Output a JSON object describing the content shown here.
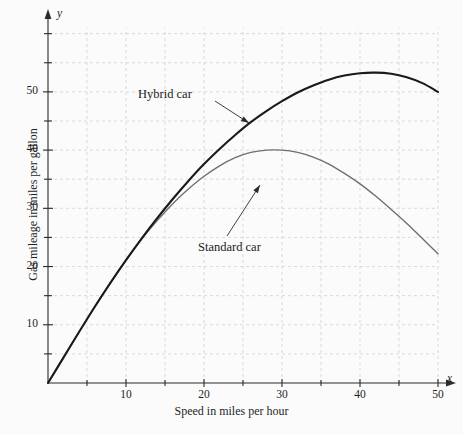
{
  "chart_data": {
    "type": "line",
    "title": "",
    "xlabel": "Speed in miles per hour",
    "ylabel": "Gas mileage in miles per gallon",
    "x_axis_variable": "x",
    "y_axis_variable": "y",
    "xlim": [
      0,
      50
    ],
    "ylim": [
      0,
      62
    ],
    "x_ticks_major": [
      10,
      20,
      30,
      40,
      50
    ],
    "x_ticks_minor": [
      5,
      15,
      25,
      35,
      45
    ],
    "x_tick_labels": [
      "10",
      "20",
      "30",
      "40",
      "50"
    ],
    "y_ticks_major": [
      10,
      20,
      30,
      40,
      50
    ],
    "y_ticks_minor": [
      5,
      15,
      25,
      35,
      45,
      55,
      60
    ],
    "y_tick_labels": [
      "10",
      "20",
      "30",
      "40",
      "50"
    ],
    "grid": true,
    "grid_spacing_x": 5,
    "grid_spacing_y": 5,
    "legend_position": "inline-annotations",
    "series": [
      {
        "name": "Hybrid car",
        "color": "#1a1a1a",
        "x": [
          0,
          2,
          4,
          6,
          8,
          10,
          12,
          14,
          16,
          18,
          20,
          22,
          24,
          26,
          28,
          30,
          32,
          34,
          36,
          38,
          40,
          42,
          44,
          46,
          48,
          50
        ],
        "values": [
          0,
          4.4,
          8.8,
          13.1,
          17.2,
          21.1,
          24.8,
          28.3,
          31.6,
          34.7,
          37.6,
          40.2,
          42.6,
          44.8,
          46.7,
          48.4,
          49.9,
          51.1,
          52.1,
          52.8,
          53.2,
          53.3,
          53.1,
          52.5,
          51.5,
          50.0
        ]
      },
      {
        "name": "Standard car",
        "color": "#6e6e6e",
        "x": [
          0,
          2,
          4,
          6,
          8,
          10,
          12,
          14,
          16,
          18,
          20,
          22,
          24,
          26,
          28,
          30,
          32,
          34,
          36,
          38,
          40,
          42,
          44,
          46,
          48,
          50
        ],
        "values": [
          0,
          4.4,
          8.8,
          13.1,
          17.2,
          21.1,
          24.7,
          27.9,
          30.8,
          33.3,
          35.5,
          37.3,
          38.7,
          39.6,
          40.0,
          40.0,
          39.6,
          38.8,
          37.6,
          36.0,
          34.2,
          32.1,
          29.8,
          27.4,
          24.8,
          22.2
        ]
      }
    ],
    "annotations": [
      {
        "label": "Hybrid car",
        "label_x_px": 138,
        "label_y_px": 87,
        "arrow_from_px": [
          215,
          101
        ],
        "arrow_to_px": [
          249,
          123
        ]
      },
      {
        "label": "Standard car",
        "label_x_px": 198,
        "label_y_px": 240,
        "arrow_from_px": [
          227,
          236
        ],
        "arrow_to_px": [
          260,
          185
        ]
      }
    ]
  }
}
